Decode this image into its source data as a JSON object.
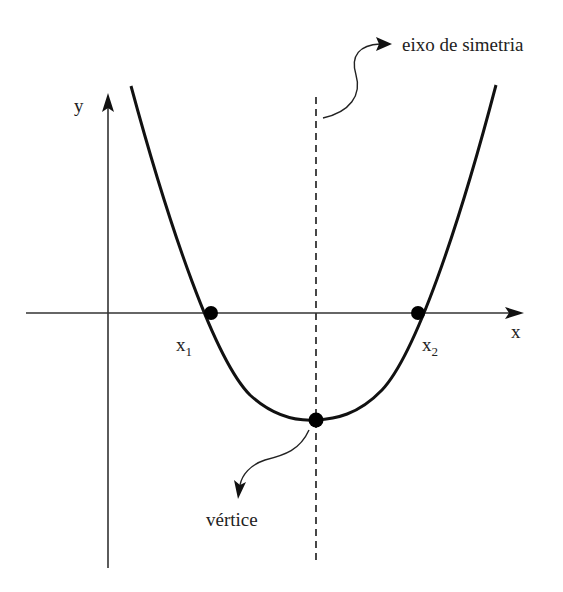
{
  "labels": {
    "y_axis": "y",
    "x_axis": "x",
    "root1": {
      "base": "x",
      "sub": "1"
    },
    "root2": {
      "base": "x",
      "sub": "2"
    },
    "symmetry_axis": "eixo de simetria",
    "vertex": "vértice"
  },
  "colors": {
    "curve": "#111111",
    "axes": "#333333",
    "dashed": "#333333",
    "background": "#ffffff"
  },
  "geometry": {
    "origin": [
      108,
      313
    ],
    "root1": [
      211,
      313
    ],
    "root2": [
      418,
      313
    ],
    "vertex": [
      316,
      420
    ]
  }
}
